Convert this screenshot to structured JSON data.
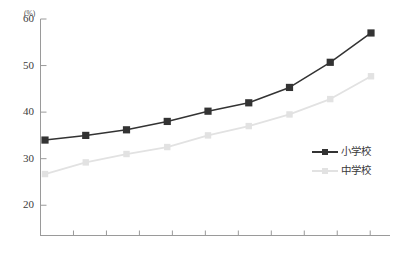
{
  "chart_data": {
    "type": "line",
    "title": "",
    "subtitle": "",
    "xlabel": "",
    "ylabel": "",
    "unit_label": "(%)",
    "ylim": [
      13.5,
      60
    ],
    "ytick_labels": [
      "60",
      "50",
      "40",
      "30",
      "20"
    ],
    "ytick_values": [
      60,
      50,
      40,
      30,
      20
    ],
    "xtick_count": 10,
    "x_tick_labels": [],
    "grid": false,
    "legend_position": "right-inside",
    "x": [
      1,
      2,
      3,
      4,
      5,
      6,
      7,
      8,
      9
    ],
    "series": [
      {
        "name": "小学校",
        "color": "#333333",
        "marker": "square",
        "values": [
          34.0,
          35.0,
          36.2,
          38.0,
          40.2,
          42.0,
          45.3,
          50.7,
          57.0
        ]
      },
      {
        "name": "中学校",
        "color": "#e2e2e2",
        "marker": "square",
        "values": [
          26.7,
          29.2,
          31.0,
          32.5,
          35.0,
          37.0,
          39.5,
          42.8,
          47.7
        ]
      }
    ]
  },
  "axes": {
    "axis_color": "#9a9a9a",
    "tick_color": "#9a9a9a"
  },
  "legend": {
    "items": [
      {
        "label": "小学校",
        "color": "#333333"
      },
      {
        "label": "中学校",
        "color": "#e2e2e2"
      }
    ]
  }
}
